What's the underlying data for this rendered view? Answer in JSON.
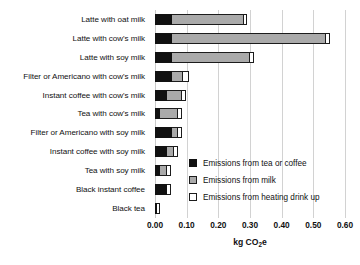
{
  "chart_data": {
    "type": "bar",
    "orientation": "horizontal",
    "stacked": true,
    "title": "",
    "xlabel": "kg CO2e",
    "xlabel_display": "kg CO",
    "xlabel_sub": "2",
    "xlabel_tail": "e",
    "ylabel": "",
    "xlim": [
      0.0,
      0.6
    ],
    "xticks": [
      0.0,
      0.1,
      0.2,
      0.3,
      0.4,
      0.5,
      0.6
    ],
    "xtick_labels": [
      "0.00",
      "0.10",
      "0.20",
      "0.30",
      "0.40",
      "0.50",
      "0.60"
    ],
    "grid": "vertical",
    "legend_position": "center-right-inside",
    "categories": [
      "Latte with oat milk",
      "Latte with cow's milk",
      "Latte with soy milk",
      "Filter or Americano with cow's milk",
      "Instant coffee with cow's milk",
      "Tea with cow's milk",
      "Filter or Americano with soy milk",
      "Instant coffee with soy milk",
      "Tea with soy milk",
      "Black instant coffee",
      "Black tea"
    ],
    "series": [
      {
        "name": "Emissions from tea or coffee",
        "color": "#111111",
        "values": [
          0.055,
          0.055,
          0.055,
          0.055,
          0.038,
          0.016,
          0.055,
          0.038,
          0.016,
          0.038,
          0.006
        ]
      },
      {
        "name": "Emissions from milk",
        "color": "#aaaaaa",
        "values": [
          0.225,
          0.485,
          0.245,
          0.035,
          0.048,
          0.057,
          0.018,
          0.022,
          0.022,
          0.0,
          0.0
        ]
      },
      {
        "name": "Emissions from heating drink up",
        "color": "#ffffff",
        "values": [
          0.01,
          0.013,
          0.013,
          0.016,
          0.013,
          0.013,
          0.013,
          0.013,
          0.013,
          0.013,
          0.01
        ]
      }
    ],
    "totals": [
      0.29,
      0.553,
      0.313,
      0.106,
      0.099,
      0.086,
      0.086,
      0.073,
      0.051,
      0.051,
      0.016
    ]
  },
  "legend": {
    "items": [
      {
        "label": "Emissions from tea or coffee",
        "swatch": "coffee"
      },
      {
        "label": "Emissions from milk",
        "swatch": "milk"
      },
      {
        "label": "Emissions from heating drink up",
        "swatch": "heat"
      }
    ]
  }
}
